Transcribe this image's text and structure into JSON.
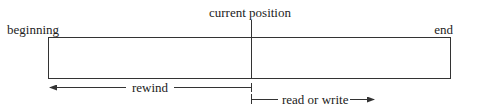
{
  "diagram": {
    "labels": {
      "current_position": "current position",
      "beginning": "beginning",
      "end": "end",
      "rewind": "rewind",
      "read_or_write": "read or write"
    },
    "colors": {
      "stroke": "#333333",
      "text": "#222222",
      "background": "#ffffff"
    }
  }
}
